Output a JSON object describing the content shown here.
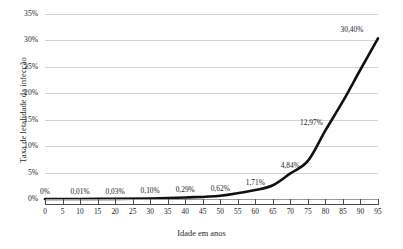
{
  "chart_data": {
    "type": "line",
    "title": "",
    "xlabel": "Idade em anos",
    "ylabel": "Taxa de letalidade da infecção",
    "x": [
      0,
      5,
      10,
      15,
      20,
      25,
      30,
      35,
      40,
      45,
      50,
      55,
      60,
      65,
      70,
      75,
      80,
      85,
      90,
      95
    ],
    "xtick_labels": [
      "0",
      "5",
      "10",
      "15",
      "20",
      "25",
      "30",
      "35",
      "40",
      "45",
      "50",
      "55",
      "60",
      "65",
      "70",
      "75",
      "80",
      "85",
      "90",
      "95"
    ],
    "xlim": [
      0,
      95
    ],
    "ylim": [
      0,
      35
    ],
    "ytick_labels": [
      "0%",
      "5%",
      "10%",
      "15%",
      "20%",
      "25%",
      "30%",
      "35%"
    ],
    "ytick_values": [
      0,
      5,
      10,
      15,
      20,
      25,
      30,
      35
    ],
    "grid": true,
    "legend": "none",
    "series": [
      {
        "name": "Taxa de letalidade da infecção",
        "color": "#111111",
        "x": [
          0,
          10,
          20,
          30,
          40,
          50,
          60,
          65,
          70,
          75,
          80,
          85,
          90,
          95
        ],
        "values": [
          0.0,
          0.01,
          0.03,
          0.1,
          0.29,
          0.62,
          1.71,
          2.6,
          4.84,
          7.2,
          12.97,
          18.5,
          24.5,
          30.4
        ]
      }
    ],
    "point_labels": [
      {
        "x": 0,
        "value": 0.0,
        "text": "0%"
      },
      {
        "x": 10,
        "value": 0.01,
        "text": "0,01%"
      },
      {
        "x": 20,
        "value": 0.03,
        "text": "0,03%"
      },
      {
        "x": 30,
        "value": 0.1,
        "text": "0,10%"
      },
      {
        "x": 40,
        "value": 0.29,
        "text": "0,29%"
      },
      {
        "x": 50,
        "value": 0.62,
        "text": "0,62%"
      },
      {
        "x": 60,
        "value": 1.71,
        "text": "1,71%"
      },
      {
        "x": 70,
        "value": 4.84,
        "text": "4,84%"
      },
      {
        "x": 80,
        "value": 12.97,
        "text": "12,97%"
      },
      {
        "x": 95,
        "value": 30.4,
        "text": "30,40%"
      }
    ],
    "colors": {
      "line": "#111111",
      "grid": "#d2d2d2",
      "axis": "#4a4a4a",
      "text": "#1c1c1c",
      "background": "#ffffff"
    }
  }
}
